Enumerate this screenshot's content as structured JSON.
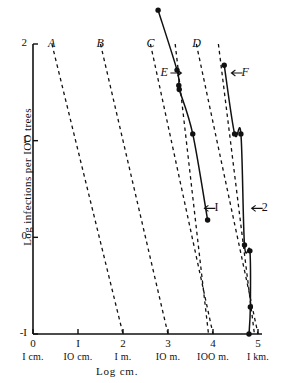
{
  "chart_data": {
    "type": "line",
    "title": "",
    "xlabel": "Log  cm.",
    "ylabel": "Log  infections  per  IOO  trees",
    "xlim": [
      0,
      5
    ],
    "ylim": [
      -1,
      2
    ],
    "grid": false,
    "legend": "inline-labels",
    "x_ticks": [
      {
        "value": 0,
        "label": "0",
        "unit": "I cm."
      },
      {
        "value": 1,
        "label": "I",
        "unit": "IO cm."
      },
      {
        "value": 2,
        "label": "2",
        "unit": "I m."
      },
      {
        "value": 3,
        "label": "3",
        "unit": "IO m."
      },
      {
        "value": 4,
        "label": "4",
        "unit": "IOO m."
      },
      {
        "value": 5,
        "label": "5",
        "unit": "I km."
      }
    ],
    "y_ticks": [
      {
        "value": 2,
        "label": "2"
      },
      {
        "value": 1,
        "label": "I"
      },
      {
        "value": 0,
        "label": "0"
      },
      {
        "value": -1,
        "label": "-I"
      }
    ],
    "series": [
      {
        "name": "A",
        "style": "dashed",
        "label": "A",
        "label_x": 0.42,
        "label_y": 2.0,
        "points": [
          [
            0.42,
            2.0
          ],
          [
            2.0,
            -1.0
          ]
        ]
      },
      {
        "name": "B",
        "style": "dashed",
        "label": "B",
        "label_x": 1.5,
        "label_y": 2.0,
        "points": [
          [
            1.5,
            2.0
          ],
          [
            3.0,
            -1.0
          ]
        ]
      },
      {
        "name": "C",
        "style": "dashed",
        "label": "C",
        "label_x": 2.61,
        "label_y": 2.0,
        "points": [
          [
            2.61,
            2.0
          ],
          [
            4.0,
            -1.0
          ]
        ]
      },
      {
        "name": "D",
        "style": "dashed",
        "label": "D",
        "label_x": 3.63,
        "label_y": 2.0,
        "points": [
          [
            3.63,
            2.0
          ],
          [
            5.0,
            -1.0
          ]
        ]
      },
      {
        "name": "E",
        "style": "dashed",
        "label": "E",
        "label_x": 2.92,
        "label_y": 1.7,
        "arrow": "right",
        "points": [
          [
            3.16,
            2.0
          ],
          [
            3.9,
            -1.0
          ]
        ]
      },
      {
        "name": "F",
        "style": "dashed",
        "label": "F",
        "label_x": 4.72,
        "label_y": 1.7,
        "arrow": "left",
        "points": [
          [
            4.12,
            2.0
          ],
          [
            4.92,
            -1.0
          ]
        ]
      },
      {
        "name": "1",
        "style": "solid",
        "label": "I",
        "label_x": 4.12,
        "label_y": 0.3,
        "arrow": "left",
        "markers": true,
        "points": [
          [
            2.78,
            2.35
          ],
          [
            3.2,
            1.73
          ],
          [
            3.24,
            1.57
          ],
          [
            3.25,
            1.53
          ],
          [
            3.55,
            1.07
          ],
          [
            3.88,
            0.18
          ]
        ]
      },
      {
        "name": "2",
        "style": "solid",
        "label": "2",
        "label_x": 5.17,
        "label_y": 0.3,
        "arrow": "left",
        "markers": true,
        "points": [
          [
            4.25,
            1.78
          ],
          [
            4.48,
            1.07
          ],
          [
            4.62,
            1.07
          ],
          [
            4.7,
            -0.08
          ],
          [
            4.82,
            -0.14
          ],
          [
            4.83,
            -0.72
          ],
          [
            4.8,
            -1.0
          ]
        ]
      }
    ]
  },
  "axes": {
    "x_title": "Log  cm.",
    "y_title": "Log  infections  per  IOO  trees"
  }
}
